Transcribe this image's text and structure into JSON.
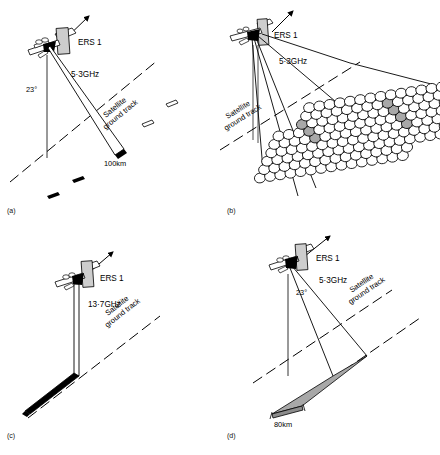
{
  "figure": {
    "background_color": "#ffffff",
    "line_color": "#000000",
    "shade_color": "#a8a8a8"
  },
  "common_labels": {
    "satellite_name": "ERS 1",
    "ground_track": "Satellite\nground track",
    "ground_track_line1": "Satellite",
    "ground_track_line2": "ground track",
    "incidence_angle": "23°"
  },
  "panels": [
    {
      "id": "a",
      "tag": "(a)",
      "mode_name": "wave-mode",
      "satellite_label": "ERS 1",
      "frequency": "5·3GHz",
      "incidence_angle": "23°",
      "swath_label": "100km",
      "ground_track_line1": "Satellite",
      "ground_track_line2": "ground track",
      "imagette_count": 5
    },
    {
      "id": "b",
      "tag": "(b)",
      "mode_name": "wind-scatterometer-mode",
      "satellite_label": "ERS 1",
      "frequency": "5·3GHz",
      "incidence_angle": "",
      "swath_label": "",
      "ground_track_line1": "Satellite",
      "ground_track_line2": "ground track",
      "cell_rows": 9,
      "cell_cols": 18
    },
    {
      "id": "c",
      "tag": "(c)",
      "mode_name": "altimeter-mode",
      "satellite_label": "ERS 1",
      "frequency": "13·7GHz",
      "incidence_angle": "",
      "swath_label": "",
      "ground_track_line1": "Satellite",
      "ground_track_line2": "ground track"
    },
    {
      "id": "d",
      "tag": "(d)",
      "mode_name": "image-mode-sar",
      "satellite_label": "ERS 1",
      "frequency": "5·3GHz",
      "incidence_angle": "23°",
      "swath_label": "80km",
      "ground_track_line1": "Satellite",
      "ground_track_line2": "ground track"
    }
  ]
}
